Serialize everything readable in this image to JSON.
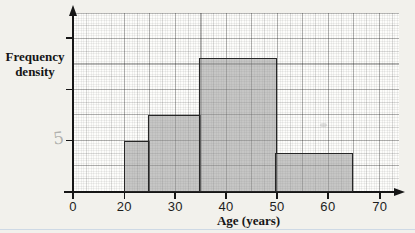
{
  "figure": {
    "background_color": "#f2f1ec",
    "paper_color": "#fdfdfb",
    "bottom_rule_color": "#aac1de"
  },
  "labels": {
    "y_axis": "Frequency\ndensity",
    "x_axis": "Age (years)"
  },
  "annotations": {
    "pencil_note": "5"
  },
  "chart_data": {
    "type": "histogram",
    "title": "",
    "xlabel": "Age (years)",
    "ylabel": "Frequency density",
    "x_tick_labels": [
      "0",
      "20",
      "30",
      "40",
      "50",
      "60",
      "70"
    ],
    "y_axis_numeric_labels": "none (3 unlabeled tick marks)",
    "bins": [
      {
        "range": [
          20,
          25
        ],
        "frequency_density": 1.0
      },
      {
        "range": [
          25,
          35
        ],
        "frequency_density": 1.5
      },
      {
        "range": [
          35,
          50
        ],
        "frequency_density": 2.6
      },
      {
        "range": [
          50,
          65
        ],
        "frequency_density": 0.75
      }
    ],
    "bar_fill": "#c7c7c7",
    "bar_border": "#262626",
    "grid": "fine graph paper, bold line every 5 years / 0.5 density units",
    "layout": {
      "origin_px": {
        "x": 73,
        "y": 192
      },
      "x20_px": 124.3,
      "px_per_year": 5.09,
      "px_per_fd_unit": 51.4,
      "x_tick_px": [
        73,
        124.3,
        175.2,
        226.1,
        277,
        327.9,
        379.8
      ],
      "y_tick_px": [
        140.7,
        89.3,
        37.9
      ],
      "plot_top_px": 13,
      "plot_right_px": 399
    }
  }
}
